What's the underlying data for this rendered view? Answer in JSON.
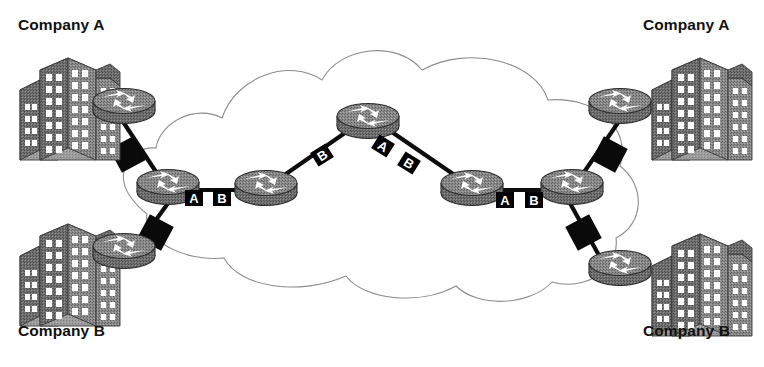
{
  "diagram": {
    "type": "network-topology",
    "background_color": "#ffffff",
    "cloud": {
      "name": "service-provider-cloud",
      "stroke_color": "#8c8c8c",
      "fill_color": "#ffffff",
      "stroke_width": 1.1
    },
    "site_labels": [
      {
        "id": "company-a-left",
        "text": "Company A",
        "corner": "top-left"
      },
      {
        "id": "company-a-right",
        "text": "Company A",
        "corner": "top-right"
      },
      {
        "id": "company-b-left",
        "text": "Company B",
        "corner": "bottom-left"
      },
      {
        "id": "company-b-right",
        "text": "Company B",
        "corner": "bottom-right"
      }
    ],
    "routers": [
      {
        "id": "ce-a-left",
        "role": "customer-edge",
        "x": 124,
        "y": 102
      },
      {
        "id": "ce-b-left",
        "role": "customer-edge",
        "x": 124,
        "y": 247
      },
      {
        "id": "pe-left",
        "role": "provider-edge",
        "x": 168,
        "y": 183
      },
      {
        "id": "p-left",
        "role": "provider-core",
        "x": 266,
        "y": 184
      },
      {
        "id": "p-top",
        "role": "provider-core",
        "x": 368,
        "y": 117
      },
      {
        "id": "p-right",
        "role": "provider-core",
        "x": 472,
        "y": 184
      },
      {
        "id": "pe-right",
        "role": "provider-edge",
        "x": 572,
        "y": 183
      },
      {
        "id": "ce-a-right",
        "role": "customer-edge",
        "x": 620,
        "y": 102
      },
      {
        "id": "ce-b-right",
        "role": "customer-edge",
        "x": 620,
        "y": 264
      }
    ],
    "buildings": [
      {
        "id": "building-a-left",
        "x": 20,
        "y": 52
      },
      {
        "id": "building-b-left",
        "x": 20,
        "y": 218
      },
      {
        "id": "building-a-right",
        "x": 652,
        "y": 52
      },
      {
        "id": "building-b-right",
        "x": 652,
        "y": 228
      }
    ],
    "link_tags": [
      {
        "id": "tag-left-a",
        "text": "A",
        "x": 194,
        "y": 198,
        "rotation": 0,
        "on_link": "pe-left--p-left"
      },
      {
        "id": "tag-left-b",
        "text": "B",
        "x": 222,
        "y": 198,
        "rotation": 0,
        "on_link": "pe-left--p-left"
      },
      {
        "id": "tag-topleft-b",
        "text": "B",
        "x": 322,
        "y": 155,
        "rotation": -32,
        "on_link": "p-left--p-top"
      },
      {
        "id": "tag-topright-a",
        "text": "A",
        "x": 383,
        "y": 146,
        "rotation": 32,
        "on_link": "p-top--p-right"
      },
      {
        "id": "tag-topright-b",
        "text": "B",
        "x": 409,
        "y": 163,
        "rotation": 32,
        "on_link": "p-top--p-right"
      },
      {
        "id": "tag-right-a",
        "text": "A",
        "x": 505,
        "y": 200,
        "rotation": 0,
        "on_link": "p-right--pe-right"
      },
      {
        "id": "tag-right-b",
        "text": "B",
        "x": 534,
        "y": 200,
        "rotation": 0,
        "on_link": "p-right--pe-right"
      }
    ],
    "tag_style": {
      "background_color": "#000000",
      "text_color": "#ffffff",
      "width": 18,
      "height": 16
    },
    "access_links": [
      {
        "id": "access-a-left",
        "from": "ce-a-left",
        "to": "pe-left"
      },
      {
        "id": "access-b-left",
        "from": "ce-b-left",
        "to": "pe-left"
      },
      {
        "id": "access-a-right",
        "from": "ce-a-right",
        "to": "pe-right"
      },
      {
        "id": "access-b-right",
        "from": "ce-b-right",
        "to": "pe-right"
      }
    ],
    "access_markers": [
      {
        "id": "marker-a-left",
        "x": 128,
        "y": 155,
        "rotation": -28
      },
      {
        "id": "marker-b-left",
        "x": 155,
        "y": 232,
        "rotation": 28
      },
      {
        "id": "marker-a-right",
        "x": 609,
        "y": 155,
        "rotation": 28
      },
      {
        "id": "marker-b-right",
        "x": 583,
        "y": 232,
        "rotation": -28
      }
    ],
    "colors": {
      "router_body": "#7a7a7a",
      "router_top": "#8f8f8f",
      "router_outline": "#2b2b2b",
      "building_face": "#9a9a9a",
      "building_side": "#6e6e6e",
      "link_line": "#0d0d0d",
      "marker_black": "#0a0a0a",
      "text": "#111111"
    }
  }
}
